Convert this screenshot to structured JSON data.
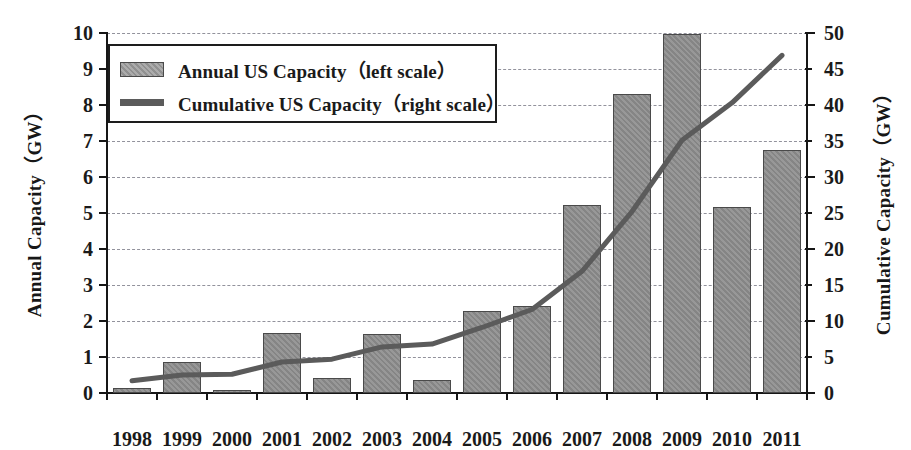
{
  "chart_data": {
    "type": "bar",
    "title": "",
    "xlabel": "",
    "ylabel": "Annual Capacity（GW）",
    "y2label": "Cumulative Capacity（GW）",
    "categories": [
      "1998",
      "1999",
      "2000",
      "2001",
      "2002",
      "2003",
      "2004",
      "2005",
      "2006",
      "2007",
      "2008",
      "2009",
      "2010",
      "2011"
    ],
    "ylim": [
      0,
      10
    ],
    "y2lim": [
      0,
      50
    ],
    "yticks": [
      0,
      1,
      2,
      3,
      4,
      5,
      6,
      7,
      8,
      9,
      10
    ],
    "y2ticks": [
      0,
      5,
      10,
      15,
      20,
      25,
      30,
      35,
      40,
      45,
      50
    ],
    "grid": true,
    "legend_position": "top-left",
    "series": [
      {
        "name": "Annual US Capacity（left scale）",
        "kind": "bar",
        "axis": "left",
        "unit": "GW",
        "values": [
          0.14,
          0.85,
          0.07,
          1.67,
          0.41,
          1.65,
          0.37,
          2.27,
          2.41,
          5.21,
          8.31,
          9.96,
          5.16,
          6.75
        ]
      },
      {
        "name": "Cumulative US Capacity（right scale）",
        "kind": "line",
        "axis": "right",
        "unit": "GW",
        "values": [
          1.7,
          2.5,
          2.6,
          4.3,
          4.7,
          6.4,
          6.8,
          9.1,
          11.6,
          16.9,
          25.2,
          35.1,
          40.3,
          46.9
        ]
      }
    ]
  },
  "legend": {
    "items": [
      {
        "label": "Annual US Capacity（left scale）",
        "marker": "bar-swatch"
      },
      {
        "label": "Cumulative US Capacity（right scale）",
        "marker": "line-swatch"
      }
    ]
  },
  "colors": {
    "bar_fill": "#8c8c8c",
    "bar_edge": "#4a4a4a",
    "line": "#5b5b5b",
    "grid": "#8d8d97",
    "axis": "#161616",
    "text": "#1a1a1a",
    "background": "#ffffff"
  }
}
